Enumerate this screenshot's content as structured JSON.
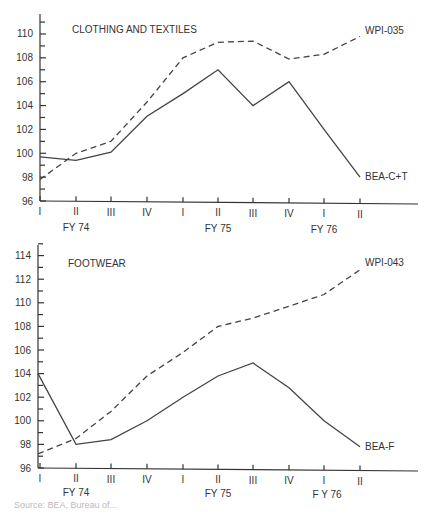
{
  "chart_data": [
    {
      "type": "line",
      "title": "CLOTHING AND TEXTILES",
      "xlabel": "",
      "ylabel": "",
      "ylim": [
        96,
        111
      ],
      "yticks": [
        96,
        98,
        100,
        102,
        104,
        106,
        108,
        110
      ],
      "x": [
        "I",
        "II",
        "III",
        "IV",
        "I",
        "II",
        "III",
        "IV",
        "I",
        "II"
      ],
      "fiscal_year_labels": [
        {
          "label": "FY 74",
          "at_index": 1
        },
        {
          "label": "FY 75",
          "at_index": 5
        },
        {
          "label": "FY 76",
          "at_index": 8.5
        }
      ],
      "series": [
        {
          "name": "WPI-035",
          "style": "dashed",
          "values": [
            97.8,
            100.0,
            101.0,
            104.3,
            108.0,
            109.3,
            109.4,
            107.9,
            108.3,
            109.8
          ]
        },
        {
          "name": "BEA-C+T",
          "style": "solid",
          "values": [
            99.7,
            99.4,
            100.1,
            103.1,
            105.0,
            107.0,
            104.0,
            106.0,
            102.0,
            98.0
          ]
        }
      ],
      "grid": false,
      "legend": "inline labels at line ends"
    },
    {
      "type": "line",
      "title": "FOOTWEAR",
      "xlabel": "",
      "ylabel": "",
      "ylim": [
        96,
        115
      ],
      "yticks": [
        96,
        98,
        100,
        102,
        104,
        106,
        108,
        110,
        112,
        114
      ],
      "x": [
        "I",
        "II",
        "III",
        "IV",
        "I",
        "II",
        "III",
        "IV",
        "I",
        "II"
      ],
      "fiscal_year_labels": [
        {
          "label": "FY 74",
          "at_index": 1
        },
        {
          "label": "FY 75",
          "at_index": 5
        },
        {
          "label": "F Y 76",
          "at_index": 8.5
        }
      ],
      "series": [
        {
          "name": "WPI-043",
          "style": "dashed",
          "values": [
            97.2,
            98.5,
            100.8,
            103.8,
            105.8,
            108.0,
            108.7,
            109.7,
            110.7,
            112.8
          ]
        },
        {
          "name": "BEA-F",
          "style": "solid",
          "values": [
            104.0,
            98.0,
            98.4,
            100.0,
            102.0,
            103.8,
            104.9,
            102.8,
            100.0,
            97.8
          ]
        }
      ],
      "grid": false,
      "legend": "inline labels at line ends"
    }
  ],
  "footer": {
    "source_text": "Source: BEA, Bureau of..."
  }
}
